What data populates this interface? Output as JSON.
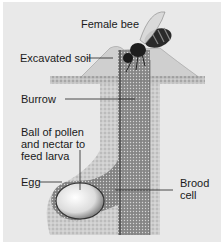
{
  "diagram": {
    "colors": {
      "background": "#e9e9e9",
      "soil": "#c9c9c9",
      "burrow": "#8a8a8a",
      "text": "#1a1a1a"
    },
    "labels": {
      "female_bee": "Female bee",
      "excavated_soil": "Excavated soil",
      "burrow": "Burrow",
      "pollen_ball": "Ball of pollen\nand nectar to\nfeed larva",
      "egg": "Egg",
      "brood_cell": "Brood\ncell"
    }
  }
}
